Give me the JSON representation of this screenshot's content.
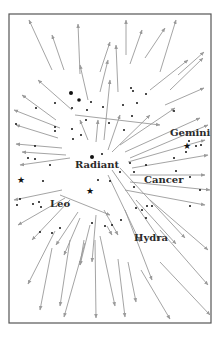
{
  "diagram": {
    "frame": {
      "x": 9,
      "y": 14,
      "width": 202,
      "height": 309,
      "color": "#555555"
    },
    "arrow_color": "#9a9a9a",
    "star_color": "#111111",
    "radiant_point": {
      "x": 92,
      "y": 160
    },
    "labels": [
      {
        "id": "gemini",
        "text": "Gemini",
        "x": 170,
        "y": 136
      },
      {
        "id": "radiant",
        "text": "Radiant",
        "x": 75,
        "y": 168
      },
      {
        "id": "cancer",
        "text": "Cancer",
        "x": 144,
        "y": 183
      },
      {
        "id": "leo",
        "text": "Leo",
        "x": 50,
        "y": 207
      },
      {
        "id": "hydra",
        "text": "Hydra",
        "x": 134,
        "y": 241
      }
    ],
    "arrows": [
      [
        52,
        70,
        29,
        20
      ],
      [
        64,
        70,
        52,
        35
      ],
      [
        80,
        74,
        78,
        24
      ],
      [
        100,
        72,
        110,
        42
      ],
      [
        126,
        55,
        126,
        20
      ],
      [
        130,
        64,
        142,
        30
      ],
      [
        145,
        58,
        165,
        28
      ],
      [
        160,
        72,
        176,
        20
      ],
      [
        178,
        75,
        204,
        52
      ],
      [
        170,
        90,
        203,
        58
      ],
      [
        165,
        105,
        204,
        88
      ],
      [
        150,
        90,
        188,
        60
      ],
      [
        118,
        92,
        116,
        45
      ],
      [
        100,
        92,
        108,
        60
      ],
      [
        88,
        100,
        80,
        65
      ],
      [
        72,
        110,
        38,
        80
      ],
      [
        56,
        120,
        22,
        95
      ],
      [
        60,
        128,
        14,
        110
      ],
      [
        58,
        138,
        16,
        125
      ],
      [
        62,
        148,
        16,
        144
      ],
      [
        66,
        155,
        22,
        152
      ],
      [
        70,
        158,
        20,
        165
      ],
      [
        88,
        140,
        80,
        120
      ],
      [
        96,
        142,
        98,
        120
      ],
      [
        104,
        140,
        110,
        80
      ],
      [
        108,
        150,
        120,
        115
      ],
      [
        112,
        152,
        150,
        115
      ],
      [
        120,
        145,
        175,
        108
      ],
      [
        125,
        152,
        200,
        118
      ],
      [
        130,
        158,
        208,
        125
      ],
      [
        128,
        162,
        205,
        140
      ],
      [
        132,
        168,
        208,
        155
      ],
      [
        130,
        175,
        205,
        175
      ],
      [
        130,
        182,
        210,
        190
      ],
      [
        125,
        190,
        205,
        205
      ],
      [
        75,
        115,
        160,
        125
      ],
      [
        62,
        190,
        14,
        200
      ],
      [
        65,
        198,
        18,
        225
      ],
      [
        70,
        200,
        32,
        240
      ],
      [
        78,
        212,
        56,
        245
      ],
      [
        80,
        218,
        64,
        255
      ],
      [
        84,
        240,
        80,
        265
      ],
      [
        90,
        225,
        80,
        265
      ],
      [
        96,
        215,
        92,
        262
      ],
      [
        104,
        210,
        118,
        235
      ],
      [
        108,
        175,
        140,
        242
      ],
      [
        112,
        170,
        160,
        240
      ],
      [
        120,
        168,
        185,
        238
      ],
      [
        136,
        200,
        176,
        244
      ],
      [
        150,
        200,
        208,
        250
      ],
      [
        160,
        230,
        208,
        285
      ],
      [
        55,
        231,
        28,
        284
      ],
      [
        52,
        248,
        40,
        310
      ],
      [
        70,
        240,
        60,
        306
      ],
      [
        85,
        243,
        64,
        317
      ],
      [
        95,
        240,
        96,
        318
      ],
      [
        100,
        236,
        115,
        306
      ],
      [
        118,
        259,
        125,
        317
      ],
      [
        128,
        262,
        136,
        302
      ],
      [
        141,
        270,
        170,
        319
      ],
      [
        160,
        262,
        210,
        315
      ],
      [
        107,
        226,
        112,
        235
      ],
      [
        60,
        195,
        110,
        215
      ],
      [
        125,
        210,
        152,
        280
      ]
    ],
    "stars": [
      {
        "x": 71,
        "y": 93,
        "r": 2
      },
      {
        "x": 79,
        "y": 100,
        "r": 1.8
      },
      {
        "x": 55,
        "y": 103,
        "r": 1
      },
      {
        "x": 72,
        "y": 108,
        "r": 1
      },
      {
        "x": 87,
        "y": 110,
        "r": 1
      },
      {
        "x": 91,
        "y": 102,
        "r": 1
      },
      {
        "x": 103,
        "y": 107,
        "r": 1
      },
      {
        "x": 123,
        "y": 105,
        "r": 1
      },
      {
        "x": 131,
        "y": 88,
        "r": 1
      },
      {
        "x": 137,
        "y": 103,
        "r": 1
      },
      {
        "x": 132,
        "y": 116,
        "r": 1
      },
      {
        "x": 146,
        "y": 94,
        "r": 1
      },
      {
        "x": 133,
        "y": 91,
        "r": 1
      },
      {
        "x": 174,
        "y": 111,
        "r": 1
      },
      {
        "x": 16,
        "y": 124,
        "r": 1
      },
      {
        "x": 36,
        "y": 108,
        "r": 1
      },
      {
        "x": 55,
        "y": 127,
        "r": 1
      },
      {
        "x": 55,
        "y": 131,
        "r": 1
      },
      {
        "x": 72,
        "y": 129,
        "r": 1
      },
      {
        "x": 73,
        "y": 139,
        "r": 1
      },
      {
        "x": 81,
        "y": 135,
        "r": 1
      },
      {
        "x": 86,
        "y": 120,
        "r": 1
      },
      {
        "x": 109,
        "y": 123,
        "r": 1
      },
      {
        "x": 124,
        "y": 130,
        "r": 1
      },
      {
        "x": 35,
        "y": 146,
        "r": 1
      },
      {
        "x": 28,
        "y": 158,
        "r": 1
      },
      {
        "x": 35,
        "y": 159,
        "r": 1
      },
      {
        "x": 50,
        "y": 165,
        "r": 1
      },
      {
        "x": 92,
        "y": 157,
        "r": 2
      },
      {
        "x": 102,
        "y": 154,
        "r": 1
      },
      {
        "x": 146,
        "y": 165,
        "r": 1
      },
      {
        "x": 189,
        "y": 141,
        "r": 1
      },
      {
        "x": 196,
        "y": 146,
        "r": 1
      },
      {
        "x": 201,
        "y": 145,
        "r": 1
      },
      {
        "x": 186,
        "y": 152,
        "r": 1
      },
      {
        "x": 174,
        "y": 158,
        "r": 1
      },
      {
        "x": 176,
        "y": 171,
        "r": 1
      },
      {
        "x": 98,
        "y": 180,
        "r": 1
      },
      {
        "x": 134,
        "y": 172,
        "r": 1
      },
      {
        "x": 120,
        "y": 172,
        "r": 1
      },
      {
        "x": 134,
        "y": 187,
        "r": 1
      },
      {
        "x": 43,
        "y": 181,
        "r": 1
      },
      {
        "x": 190,
        "y": 177,
        "r": 1
      },
      {
        "x": 200,
        "y": 190,
        "r": 1
      },
      {
        "x": 190,
        "y": 206,
        "r": 1
      },
      {
        "x": 17,
        "y": 205,
        "r": 1
      },
      {
        "x": 20,
        "y": 199,
        "r": 1
      },
      {
        "x": 33,
        "y": 204,
        "r": 1
      },
      {
        "x": 39,
        "y": 202,
        "r": 1
      },
      {
        "x": 41,
        "y": 207,
        "r": 1
      },
      {
        "x": 40,
        "y": 232,
        "r": 1
      },
      {
        "x": 52,
        "y": 233,
        "r": 1
      },
      {
        "x": 60,
        "y": 228,
        "r": 1
      },
      {
        "x": 92,
        "y": 223,
        "r": 1
      },
      {
        "x": 105,
        "y": 226,
        "r": 1
      },
      {
        "x": 112,
        "y": 225,
        "r": 1
      },
      {
        "x": 121,
        "y": 220,
        "r": 1
      },
      {
        "x": 136,
        "y": 208,
        "r": 1
      },
      {
        "x": 142,
        "y": 210,
        "r": 1
      },
      {
        "x": 147,
        "y": 206,
        "r": 1
      },
      {
        "x": 152,
        "y": 206,
        "r": 1
      },
      {
        "x": 146,
        "y": 218,
        "r": 1
      },
      {
        "x": 130,
        "y": 163,
        "r": 1
      },
      {
        "x": 110,
        "y": 181,
        "r": 1
      }
    ],
    "bright_stars": [
      {
        "x": 187,
        "y": 146,
        "name": "gemini-star"
      },
      {
        "x": 21,
        "y": 180,
        "name": "leo-star"
      },
      {
        "x": 90,
        "y": 191,
        "name": "cancer-star"
      }
    ]
  }
}
